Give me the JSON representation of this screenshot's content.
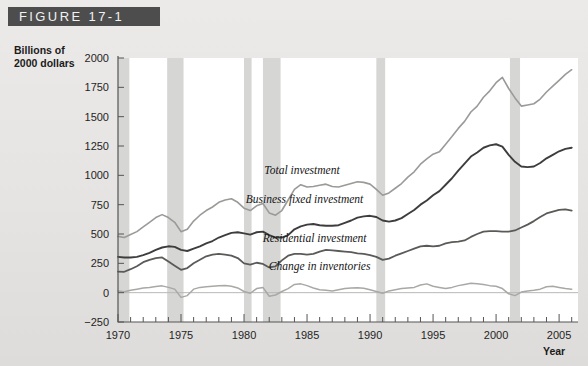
{
  "figure": {
    "banner_label": "FIGURE 17-1"
  },
  "axes": {
    "ylabel_line1": "Billions of",
    "ylabel_line2": "2000 dollars",
    "xlabel": "Year"
  },
  "chart_data": {
    "type": "line",
    "title": "FIGURE 17-1",
    "xlabel": "Year",
    "ylabel": "Billions of 2000 dollars",
    "xlim": [
      1970,
      2006.5
    ],
    "ylim": [
      -250,
      2000
    ],
    "grid": false,
    "legend_position": "inline-annotations",
    "ytick_labels": [
      "2000",
      "1750",
      "1500",
      "1250",
      "1000",
      "750",
      "500",
      "250",
      "0",
      "-250"
    ],
    "yticks": [
      2000,
      1750,
      1500,
      1250,
      1000,
      750,
      500,
      250,
      0,
      -250
    ],
    "xtick_labels": [
      "1970",
      "1975",
      "1980",
      "1985",
      "1990",
      "1995",
      "2000",
      "2005"
    ],
    "xticks": [
      1970,
      1975,
      1980,
      1985,
      1990,
      1995,
      2000,
      2005
    ],
    "minor_xtick_step": 1,
    "annotations": [
      {
        "text": "Total investment",
        "x": 1984.6,
        "y": 1010
      },
      {
        "text": "Business fixed investment",
        "x": 1984.8,
        "y": 760
      },
      {
        "text": "Residential investment",
        "x": 1985.6,
        "y": 430
      },
      {
        "text": "Change in inventories",
        "x": 1986.0,
        "y": 195
      }
    ],
    "recession_bands": [
      {
        "start": 1969.9,
        "end": 1970.9
      },
      {
        "start": 1973.9,
        "end": 1975.2
      },
      {
        "start": 1980.0,
        "end": 1980.6
      },
      {
        "start": 1981.5,
        "end": 1982.9
      },
      {
        "start": 1990.5,
        "end": 1991.2
      },
      {
        "start": 2001.1,
        "end": 2001.9
      }
    ],
    "x": [
      1970,
      1970.5,
      1971,
      1971.5,
      1972,
      1972.5,
      1973,
      1973.5,
      1974,
      1974.5,
      1975,
      1975.5,
      1976,
      1976.5,
      1977,
      1977.5,
      1978,
      1978.5,
      1979,
      1979.5,
      1980,
      1980.5,
      1981,
      1981.5,
      1982,
      1982.5,
      1983,
      1983.5,
      1984,
      1984.5,
      1985,
      1985.5,
      1986,
      1986.5,
      1987,
      1987.5,
      1988,
      1988.5,
      1989,
      1989.5,
      1990,
      1990.5,
      1991,
      1991.5,
      1992,
      1992.5,
      1993,
      1993.5,
      1994,
      1994.5,
      1995,
      1995.5,
      1996,
      1996.5,
      1997,
      1997.5,
      1998,
      1998.5,
      1999,
      1999.5,
      2000,
      2000.5,
      2001,
      2001.5,
      2002,
      2002.5,
      2003,
      2003.5,
      2004,
      2004.5,
      2005,
      2005.5,
      2006
    ],
    "series": [
      {
        "name": "Total investment",
        "color": "#9a9a98",
        "values": [
          480,
          470,
          495,
          520,
          560,
          600,
          640,
          665,
          640,
          600,
          520,
          540,
          610,
          660,
          700,
          730,
          770,
          790,
          800,
          770,
          720,
          700,
          740,
          760,
          680,
          660,
          700,
          790,
          880,
          920,
          900,
          905,
          915,
          925,
          905,
          900,
          915,
          930,
          945,
          940,
          925,
          880,
          830,
          850,
          890,
          930,
          985,
          1030,
          1095,
          1140,
          1180,
          1200,
          1265,
          1330,
          1400,
          1460,
          1540,
          1590,
          1665,
          1720,
          1790,
          1835,
          1740,
          1660,
          1590,
          1600,
          1610,
          1650,
          1710,
          1760,
          1810,
          1860,
          1900
        ]
      },
      {
        "name": "Business fixed investment",
        "color": "#3d3d3d",
        "values": [
          305,
          300,
          300,
          305,
          320,
          340,
          365,
          385,
          395,
          390,
          365,
          355,
          375,
          395,
          420,
          440,
          470,
          490,
          510,
          515,
          505,
          495,
          515,
          520,
          490,
          470,
          470,
          490,
          540,
          565,
          580,
          585,
          575,
          570,
          570,
          575,
          595,
          615,
          640,
          650,
          655,
          645,
          615,
          605,
          615,
          635,
          670,
          705,
          750,
          785,
          830,
          865,
          920,
          975,
          1040,
          1100,
          1160,
          1195,
          1235,
          1255,
          1265,
          1245,
          1175,
          1115,
          1075,
          1070,
          1075,
          1105,
          1145,
          1175,
          1205,
          1225,
          1235
        ]
      },
      {
        "name": "Residential investment",
        "color": "#5a5a58",
        "values": [
          180,
          178,
          200,
          225,
          260,
          280,
          295,
          300,
          265,
          230,
          195,
          210,
          250,
          280,
          310,
          325,
          330,
          325,
          315,
          295,
          250,
          240,
          255,
          245,
          215,
          225,
          275,
          315,
          330,
          330,
          325,
          330,
          350,
          365,
          360,
          355,
          350,
          345,
          335,
          330,
          320,
          305,
          280,
          290,
          315,
          335,
          355,
          375,
          395,
          400,
          395,
          400,
          420,
          430,
          435,
          445,
          475,
          500,
          520,
          525,
          525,
          520,
          520,
          530,
          555,
          580,
          610,
          645,
          675,
          690,
          705,
          710,
          700
        ]
      },
      {
        "name": "Change in inventories",
        "color": "#a8a8a6",
        "values": [
          15,
          8,
          20,
          30,
          40,
          45,
          52,
          58,
          45,
          30,
          -40,
          -25,
          30,
          45,
          50,
          55,
          60,
          62,
          55,
          40,
          10,
          -5,
          35,
          45,
          -30,
          -20,
          10,
          35,
          70,
          75,
          60,
          40,
          25,
          20,
          15,
          25,
          35,
          40,
          42,
          38,
          25,
          10,
          -5,
          15,
          25,
          35,
          40,
          45,
          65,
          75,
          55,
          45,
          35,
          45,
          60,
          70,
          80,
          75,
          70,
          60,
          55,
          35,
          -10,
          -25,
          5,
          15,
          20,
          30,
          50,
          55,
          45,
          35,
          30
        ]
      }
    ]
  }
}
